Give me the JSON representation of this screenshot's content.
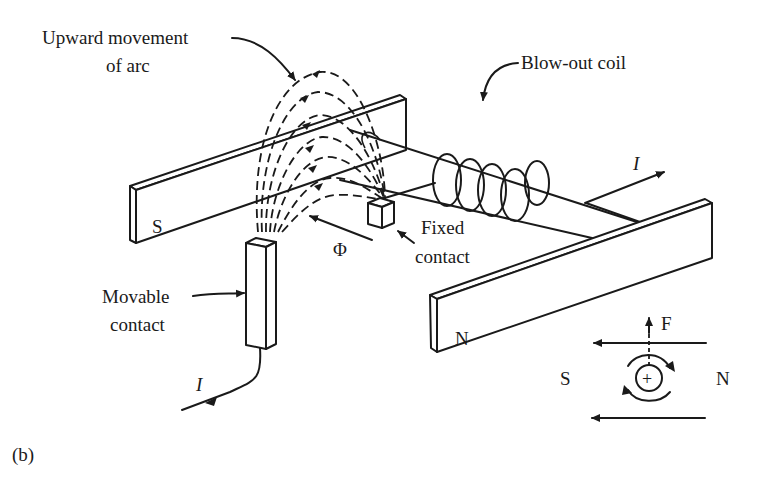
{
  "figure": {
    "panel_label": "(b)",
    "labels": {
      "arc_movement_line1": "Upward movement",
      "arc_movement_line2": "of arc",
      "blowout_coil": "Blow-out coil",
      "fixed_contact_line1": "Fixed",
      "fixed_contact_line2": "contact",
      "movable_contact_line1": "Movable",
      "movable_contact_line2": "contact",
      "current_out": "I",
      "current_in": "I",
      "flux": "Φ",
      "pole_left_magnet": "S",
      "pole_right_magnet": "N"
    },
    "inset": {
      "force": "F",
      "pole_left": "S",
      "pole_right": "N",
      "conductor_symbol": "+"
    },
    "colors": {
      "ink": "#1a1a1a",
      "background": "#ffffff"
    }
  }
}
